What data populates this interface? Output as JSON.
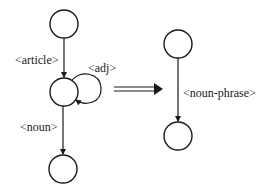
{
  "diagram": {
    "left_graph": {
      "nodes": [
        {
          "id": "n1",
          "cx": 64,
          "cy": 24,
          "r": 14
        },
        {
          "id": "n2",
          "cx": 64,
          "cy": 92,
          "r": 14
        },
        {
          "id": "n3",
          "cx": 63,
          "cy": 169,
          "r": 14
        }
      ],
      "edges": [
        {
          "from": "n1",
          "to": "n2",
          "label": "<article>"
        },
        {
          "from": "n2",
          "to": "n2",
          "label": "<adj>"
        },
        {
          "from": "n2",
          "to": "n3",
          "label": "<noun>"
        }
      ]
    },
    "transform_arrow": {
      "style": "double-arrow"
    },
    "right_graph": {
      "nodes": [
        {
          "id": "m1",
          "cx": 178,
          "cy": 44,
          "r": 14
        },
        {
          "id": "m2",
          "cx": 178,
          "cy": 136,
          "r": 14
        }
      ],
      "edges": [
        {
          "from": "m1",
          "to": "m2",
          "label": "<noun-phrase>"
        }
      ]
    },
    "colors": {
      "stroke": "#1a1a1a",
      "background": "#ffffff"
    }
  }
}
